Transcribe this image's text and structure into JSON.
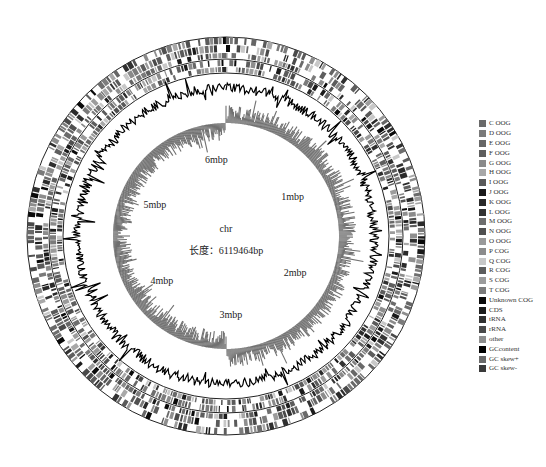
{
  "chart_data": {
    "type": "circos",
    "title": "",
    "genome": {
      "name": "chr",
      "length_label": "长度：6119464bp",
      "length_bp": 6119464
    },
    "ticks": [
      {
        "label": "1mbp",
        "pos": 1000000
      },
      {
        "label": "2mbp",
        "pos": 2000000
      },
      {
        "label": "3mbp",
        "pos": 3000000
      },
      {
        "label": "4mbp",
        "pos": 4000000
      },
      {
        "label": "5mbp",
        "pos": 5000000
      },
      {
        "label": "6mbp",
        "pos": 6000000
      }
    ],
    "tracks": [
      {
        "name": "CDS forward strand (COG colored)",
        "type": "features",
        "r_inner": 178,
        "r_outer": 198
      },
      {
        "name": "CDS reverse strand (COG colored)",
        "type": "features",
        "r_inner": 164,
        "r_outer": 176
      },
      {
        "name": "GC content",
        "type": "line",
        "r_base": 148,
        "color": "#111111"
      },
      {
        "name": "GC skew",
        "type": "histogram",
        "r_base": 113,
        "color": "#6e6e6e"
      }
    ],
    "legend": [
      {
        "label": "C OOG",
        "color": "#6a6a6a"
      },
      {
        "label": "D OOG",
        "color": "#7a7a7a"
      },
      {
        "label": "E OOG",
        "color": "#666666"
      },
      {
        "label": "F OOG",
        "color": "#5e5e5e"
      },
      {
        "label": "G OOG",
        "color": "#8a8a8a"
      },
      {
        "label": "H OOG",
        "color": "#a8a8a8"
      },
      {
        "label": "I OOG",
        "color": "#5a5a5a"
      },
      {
        "label": "J OOG",
        "color": "#1a1a1a"
      },
      {
        "label": "K OOG",
        "color": "#2a2a2a"
      },
      {
        "label": "L OOG",
        "color": "#333333"
      },
      {
        "label": "M OOG",
        "color": "#6e6e6e"
      },
      {
        "label": "N OOG",
        "color": "#505050"
      },
      {
        "label": "O OOG",
        "color": "#9a9a9a"
      },
      {
        "label": "P COG",
        "color": "#8c8c8c"
      },
      {
        "label": "Q COG",
        "color": "#c8c8c8"
      },
      {
        "label": "R COG",
        "color": "#5c5c5c"
      },
      {
        "label": "S COG",
        "color": "#9c9c9c"
      },
      {
        "label": "T COG",
        "color": "#7c7c7c"
      },
      {
        "label": "Unknown COG",
        "color": "#0a0a0a"
      },
      {
        "label": "CDS",
        "color": "#1c1c1c"
      },
      {
        "label": "tRNA",
        "color": "#303030"
      },
      {
        "label": "rRNA",
        "color": "#4a4a4a"
      },
      {
        "label": "other",
        "color": "#8e8e8e"
      },
      {
        "label": "GCcontent",
        "color": "#000000"
      },
      {
        "label": "GC skew+",
        "color": "#6a6a6a"
      },
      {
        "label": "GC skew-",
        "color": "#3a3a3a"
      }
    ]
  }
}
